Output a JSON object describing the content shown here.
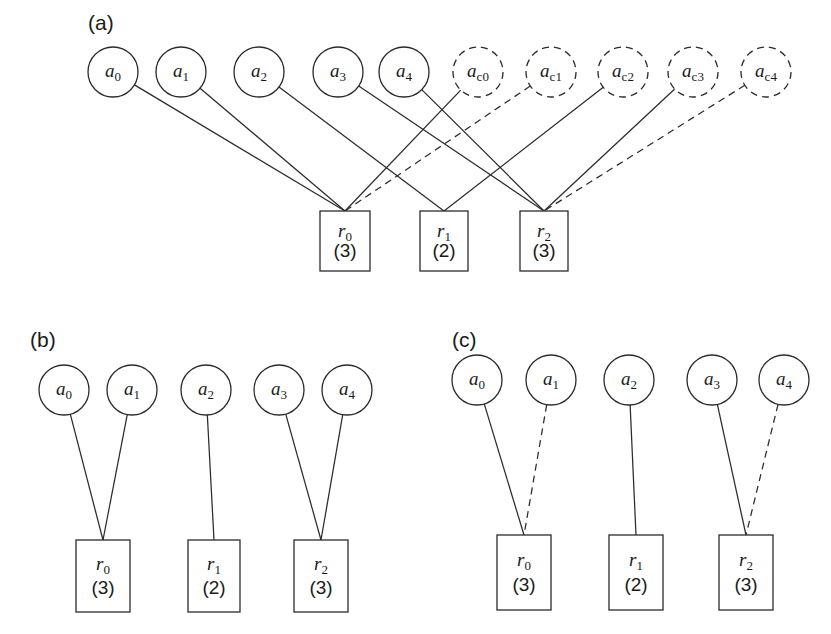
{
  "figure": {
    "panels": [
      {
        "id": "a",
        "label": "(a)",
        "description": "Full view with real agents and candidate (dashed) agents connected to resources",
        "agents": [
          {
            "id": "a0",
            "label": "a",
            "sub": "0",
            "style": "solid",
            "cx": 113,
            "cy": 72
          },
          {
            "id": "a1",
            "label": "a",
            "sub": "1",
            "style": "solid",
            "cx": 181,
            "cy": 72
          },
          {
            "id": "a2",
            "label": "a",
            "sub": "2",
            "style": "solid",
            "cx": 259,
            "cy": 72
          },
          {
            "id": "a3",
            "label": "a",
            "sub": "3",
            "style": "solid",
            "cx": 338,
            "cy": 72
          },
          {
            "id": "a4",
            "label": "a",
            "sub": "4",
            "style": "solid",
            "cx": 404,
            "cy": 72
          },
          {
            "id": "ac0",
            "label": "a",
            "sub": "c0",
            "style": "dashed",
            "cx": 478,
            "cy": 72
          },
          {
            "id": "ac1",
            "label": "a",
            "sub": "c1",
            "style": "dashed",
            "cx": 551,
            "cy": 72
          },
          {
            "id": "ac2",
            "label": "a",
            "sub": "c2",
            "style": "dashed",
            "cx": 623,
            "cy": 72
          },
          {
            "id": "ac3",
            "label": "a",
            "sub": "c3",
            "style": "dashed",
            "cx": 693,
            "cy": 72
          },
          {
            "id": "ac4",
            "label": "a",
            "sub": "c4",
            "style": "dashed",
            "cx": 766,
            "cy": 72
          }
        ],
        "agent_radius": 25,
        "resources": [
          {
            "id": "r0",
            "label": "r",
            "sub": "0",
            "capacity": "(3)",
            "x": 320,
            "y": 211,
            "w": 50,
            "h": 60
          },
          {
            "id": "r1",
            "label": "r",
            "sub": "1",
            "capacity": "(2)",
            "x": 420,
            "y": 211,
            "w": 48,
            "h": 60
          },
          {
            "id": "r2",
            "label": "r",
            "sub": "2",
            "capacity": "(3)",
            "x": 520,
            "y": 211,
            "w": 48,
            "h": 60
          }
        ],
        "edges": [
          {
            "from": "a0",
            "to": "r0",
            "style": "solid"
          },
          {
            "from": "a1",
            "to": "r0",
            "style": "solid"
          },
          {
            "from": "a2",
            "to": "r1",
            "style": "solid"
          },
          {
            "from": "a3",
            "to": "r2",
            "style": "solid"
          },
          {
            "from": "a4",
            "to": "r2",
            "style": "solid"
          },
          {
            "from": "ac0",
            "to": "r0",
            "style": "solid"
          },
          {
            "from": "ac1",
            "to": "r0",
            "style": "dashed"
          },
          {
            "from": "ac2",
            "to": "r1",
            "style": "solid"
          },
          {
            "from": "ac3",
            "to": "r2",
            "style": "solid"
          },
          {
            "from": "ac4",
            "to": "r2",
            "style": "dashed"
          }
        ]
      },
      {
        "id": "b",
        "label": "(b)",
        "description": "Reduced view, all assignments solid",
        "agents": [
          {
            "id": "a0",
            "label": "a",
            "sub": "0",
            "style": "solid",
            "cx": 64,
            "cy": 390
          },
          {
            "id": "a1",
            "label": "a",
            "sub": "1",
            "style": "solid",
            "cx": 132,
            "cy": 390
          },
          {
            "id": "a2",
            "label": "a",
            "sub": "2",
            "style": "solid",
            "cx": 206,
            "cy": 390
          },
          {
            "id": "a3",
            "label": "a",
            "sub": "3",
            "style": "solid",
            "cx": 279,
            "cy": 390
          },
          {
            "id": "a4",
            "label": "a",
            "sub": "4",
            "style": "solid",
            "cx": 347,
            "cy": 390
          }
        ],
        "agent_radius": 25,
        "resources": [
          {
            "id": "r0",
            "label": "r",
            "sub": "0",
            "capacity": "(3)",
            "x": 76,
            "y": 540,
            "w": 54,
            "h": 72
          },
          {
            "id": "r1",
            "label": "r",
            "sub": "1",
            "capacity": "(2)",
            "x": 188,
            "y": 540,
            "w": 52,
            "h": 72
          },
          {
            "id": "r2",
            "label": "r",
            "sub": "2",
            "capacity": "(3)",
            "x": 294,
            "y": 540,
            "w": 54,
            "h": 72
          }
        ],
        "edges": [
          {
            "from": "a0",
            "to": "r0",
            "style": "solid"
          },
          {
            "from": "a1",
            "to": "r0",
            "style": "solid"
          },
          {
            "from": "a2",
            "to": "r1",
            "style": "solid"
          },
          {
            "from": "a3",
            "to": "r2",
            "style": "solid"
          },
          {
            "from": "a4",
            "to": "r2",
            "style": "solid"
          }
        ]
      },
      {
        "id": "c",
        "label": "(c)",
        "description": "Reduced view with some assignments shown dashed",
        "agents": [
          {
            "id": "a0",
            "label": "a",
            "sub": "0",
            "style": "solid",
            "cx": 477,
            "cy": 380
          },
          {
            "id": "a1",
            "label": "a",
            "sub": "1",
            "style": "solid",
            "cx": 551,
            "cy": 380
          },
          {
            "id": "a2",
            "label": "a",
            "sub": "2",
            "style": "solid",
            "cx": 629,
            "cy": 380
          },
          {
            "id": "a3",
            "label": "a",
            "sub": "3",
            "style": "solid",
            "cx": 712,
            "cy": 380
          },
          {
            "id": "a4",
            "label": "a",
            "sub": "4",
            "style": "solid",
            "cx": 784,
            "cy": 380
          }
        ],
        "agent_radius": 25,
        "resources": [
          {
            "id": "r0",
            "label": "r",
            "sub": "0",
            "capacity": "(3)",
            "x": 497,
            "y": 535,
            "w": 54,
            "h": 75
          },
          {
            "id": "r1",
            "label": "r",
            "sub": "1",
            "capacity": "(2)",
            "x": 609,
            "y": 535,
            "w": 54,
            "h": 75
          },
          {
            "id": "r2",
            "label": "r",
            "sub": "2",
            "capacity": "(3)",
            "x": 719,
            "y": 535,
            "w": 54,
            "h": 75
          }
        ],
        "edges": [
          {
            "from": "a0",
            "to": "r0",
            "style": "solid"
          },
          {
            "from": "a1",
            "to": "r0",
            "style": "dashed"
          },
          {
            "from": "a2",
            "to": "r1",
            "style": "solid"
          },
          {
            "from": "a3",
            "to": "r2",
            "style": "solid"
          },
          {
            "from": "a4",
            "to": "r2",
            "style": "dashed"
          }
        ]
      }
    ],
    "panel_label_positions": {
      "a": {
        "x": 88,
        "y": 30
      },
      "b": {
        "x": 30,
        "y": 347
      },
      "c": {
        "x": 452,
        "y": 347
      }
    },
    "colors": {
      "stroke": "#2b2b2b",
      "fill": "#ffffff",
      "text": "#1a1a1a"
    }
  }
}
